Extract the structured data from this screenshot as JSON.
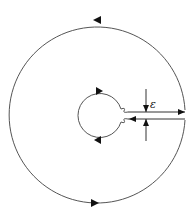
{
  "diagram": {
    "label_epsilon": "ε",
    "colors": {
      "stroke": "#555555",
      "arrow": "#111111",
      "background": "#ffffff"
    },
    "outer_circle": {
      "cx": 97,
      "cy": 112,
      "r": 88,
      "direction": "counterclockwise"
    },
    "inner_circle": {
      "cx": 100,
      "cy": 115,
      "r": 24,
      "direction": "clockwise"
    },
    "cut": {
      "top_y": 112,
      "bottom_y": 119,
      "x_start": 128,
      "x_end": 185
    },
    "gap_marker": {
      "x": 146
    }
  }
}
